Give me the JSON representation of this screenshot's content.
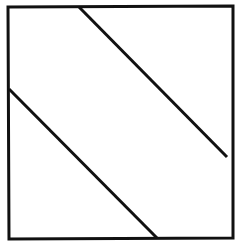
{
  "canvas": {
    "width": 239,
    "height": 243,
    "background": "#ffffff"
  },
  "stroke": {
    "color": "#111111",
    "width": 3
  },
  "square": {
    "points": [
      [
        8,
        7
      ],
      [
        233,
        6
      ],
      [
        233,
        238
      ],
      [
        9,
        239
      ]
    ]
  },
  "lines": [
    {
      "name": "upper-diagonal",
      "x1": 79,
      "y1": 7,
      "x2": 227,
      "y2": 157
    },
    {
      "name": "lower-diagonal",
      "x1": 9,
      "y1": 89,
      "x2": 157,
      "y2": 238
    }
  ]
}
